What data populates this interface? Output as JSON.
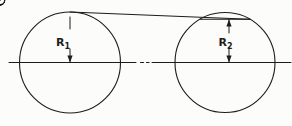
{
  "drawing": {
    "description": "Two-pulley bolt-circle technical drawing with radius dimensions",
    "colors": {
      "background": "#fcfcfa",
      "ink": "#1c1c1c"
    },
    "canvas": {
      "width": 292,
      "height": 126
    },
    "labels": {
      "r1": {
        "main": "R",
        "sub": "1"
      },
      "r2": {
        "main": "R",
        "sub": "2"
      }
    },
    "centerline": {
      "y": 62.5,
      "segments": [
        [
          9,
          136
        ],
        [
          152,
          291
        ]
      ],
      "dashes": [
        [
          140.5,
          143.5
        ],
        [
          146.5,
          149
        ]
      ]
    },
    "circles": {
      "left": {
        "cx": 70,
        "cy": 62.5,
        "r": 50.5,
        "markers": [
          {
            "angle": 90,
            "type": "center"
          },
          {
            "angle": 150,
            "type": "cross"
          },
          {
            "angle": 210,
            "type": "cross"
          },
          {
            "angle": 270,
            "type": "center"
          },
          {
            "angle": 330,
            "type": "cross"
          },
          {
            "angle": 30,
            "type": "cross"
          }
        ]
      },
      "right": {
        "cx": 225,
        "cy": 62.5,
        "r": 50,
        "markers": [
          {
            "angle": 0,
            "type": "center"
          },
          {
            "angle": 60,
            "type": "cross"
          },
          {
            "angle": 120,
            "type": "cross"
          },
          {
            "angle": 180,
            "type": "center"
          },
          {
            "angle": 240,
            "type": "cross"
          },
          {
            "angle": 300,
            "type": "cross"
          }
        ]
      }
    },
    "tangent_line": {
      "from": {
        "circle": "left",
        "angle": 90
      },
      "to": {
        "circle": "right",
        "angle": 60
      }
    },
    "chord_line": {
      "circle": "right",
      "from_angle": 120,
      "to_angle": 60
    },
    "dimensions": {
      "r1": {
        "x": 70,
        "top": 17,
        "bottom": 62.5,
        "gap": [
          29,
          49
        ],
        "arrows": [
          "down"
        ],
        "label_x": 56,
        "label_y": 45.5
      },
      "r2": {
        "x": 229,
        "top": 19.5,
        "bottom": 62.5,
        "gap": [
          33,
          48
        ],
        "arrows": [
          "up",
          "down"
        ],
        "label_x": 218.5,
        "label_y": 45.5
      }
    },
    "marker_style": {
      "radius": 4.6,
      "center_tick": 8,
      "cross_half": 3.3,
      "radial_tick": 7.5
    }
  }
}
